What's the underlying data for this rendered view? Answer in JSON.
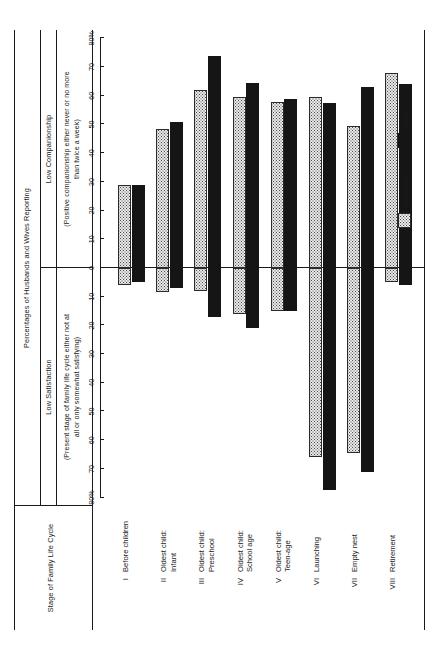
{
  "figure": {
    "spanner_title": "Percentages of Husbands and Wives Reporting",
    "stub_header": "Stage of Family Life Cycle",
    "panels": [
      {
        "key": "low_satisfaction",
        "title": "Low Satisfaction",
        "subtitle": "(Present stage of family life cycle either not at\nall or only somewhat satisfying)"
      },
      {
        "key": "low_companionship",
        "title": "Low Companionship",
        "subtitle": "(Positive companionship either never or no more\nthan twice a week)"
      }
    ]
  },
  "legend": {
    "position": "bottom-right",
    "entries": [
      {
        "label": "Husbands",
        "swatch": "stippled-light-gray",
        "color": "#e9e9e9"
      },
      {
        "label": "Wives",
        "swatch": "solid-black",
        "color": "#151515"
      }
    ]
  },
  "chart_data": {
    "type": "bar",
    "orientation": "back-to-back-horizontal",
    "title": "Percentages of Husbands and Wives Reporting",
    "categories": [
      "I Before children",
      "II Oldest child: Infant",
      "III Oldest child: Preschool",
      "IV Oldest child: School age",
      "V Oldest child: Teen-age",
      "VI Launching",
      "VII Empty nest",
      "VIII Retirement"
    ],
    "category_numerals": [
      "I",
      "II",
      "III",
      "IV",
      "V",
      "VI",
      "VII",
      "VIII"
    ],
    "category_names": [
      "Before children",
      "Oldest child:\nInfant",
      "Oldest child:\nPreschool",
      "Oldest child:\nSchool age",
      "Oldest child:\nTeen-age",
      "Launching",
      "Empty nest",
      "Retirement"
    ],
    "panels": [
      {
        "name": "Low Satisfaction",
        "direction": "left",
        "axis_ticks": [
          0,
          10,
          20,
          30,
          40,
          50,
          60,
          70,
          80
        ],
        "axis_tick_labels": [
          "0",
          "10",
          "20",
          "30",
          "40",
          "50",
          "60",
          "70",
          "80%"
        ],
        "axis_max": 80,
        "series": [
          {
            "name": "Husbands",
            "values": [
              6,
              8.5,
              8,
              16,
              15,
              66,
              64.5,
              5
            ]
          },
          {
            "name": "Wives",
            "values": [
              5,
              7,
              17,
              21,
              15,
              77.5,
              71,
              6
            ]
          }
        ]
      },
      {
        "name": "Low Companionship",
        "direction": "right",
        "axis_ticks": [
          0,
          10,
          20,
          30,
          40,
          50,
          60,
          70,
          80
        ],
        "axis_tick_labels": [
          "0",
          "10",
          "20",
          "30",
          "40",
          "50",
          "60",
          "70",
          "80%"
        ],
        "axis_max": 80,
        "series": [
          {
            "name": "Husbands",
            "values": [
              29,
              48.5,
              62,
              59.5,
              58,
              59.5,
              49.5,
              68
            ]
          },
          {
            "name": "Wives",
            "values": [
              29,
              51,
              74,
              64.5,
              59,
              57.5,
              63,
              64
            ]
          }
        ]
      }
    ],
    "xlabel": "",
    "ylabel": "Stage of Family Life Cycle",
    "grid": false
  }
}
